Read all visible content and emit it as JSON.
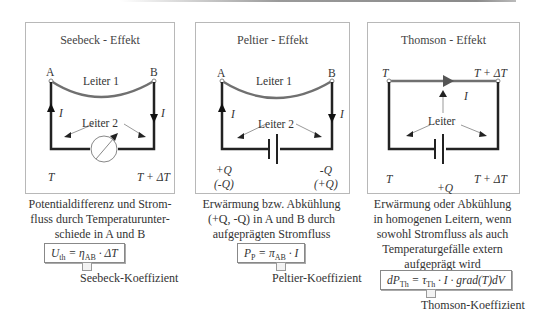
{
  "panels": [
    {
      "title": "Seebeck - Effekt",
      "node_left": "A",
      "node_right": "B",
      "wire_top": "Leiter 1",
      "wire_bottom": "Leiter 2",
      "current_left": "I",
      "current_right": "I",
      "temp_left": "T",
      "temp_right": "T + ΔT",
      "element": "voltmeter",
      "description": [
        "Potentialdifferenz und Strom-",
        "fluss durch Temperaturunter-",
        "schiede in A und B"
      ],
      "formula": {
        "lhs": "U",
        "lhs_sub": "th",
        "eq": " = ",
        "coef": "η",
        "coef_sub": "AB",
        "rhs": " · ΔT"
      },
      "coefficient_label": "Seebeck-Koeffizient"
    },
    {
      "title": "Peltier - Effekt",
      "node_left": "A",
      "node_right": "B",
      "wire_top": "Leiter 1",
      "wire_bottom": "Leiter 2",
      "current_left": "I",
      "current_right": "I",
      "heat_left": [
        "+Q",
        "(-Q)"
      ],
      "heat_right": [
        "-Q",
        "(+Q)"
      ],
      "element": "battery",
      "description": [
        "Erwärmung bzw. Abkühlung",
        "(+Q, -Q) in A und B durch",
        "aufgeprägten Stromfluss"
      ],
      "formula": {
        "lhs": "P",
        "lhs_sub": "P",
        "eq": " = ",
        "coef": "π",
        "coef_sub": "AB",
        "rhs": " · I"
      },
      "coefficient_label": "Peltier-Koeffizient"
    },
    {
      "title": "Thomson - Effekt",
      "temp_top_left": "T",
      "temp_top_right": "T + ΔT",
      "wire": "Leiter",
      "current": "I",
      "temp_left": "T",
      "temp_right": "T + ΔT",
      "heat": "+Q",
      "element": "battery",
      "description": [
        "Erwärmung oder Abkühlung",
        "in homogenen Leitern, wenn",
        "sowohl Stromfluss als auch",
        "Temperaturgefälle extern",
        "aufgeprägt wird"
      ],
      "formula": {
        "lhs": "dP",
        "lhs_sub": "Th",
        "eq": " = ",
        "coef": "τ",
        "coef_sub": "Th",
        "rhs": " · I · grad(T)dV"
      },
      "coefficient_label": "Thomson-Koeffizient"
    }
  ],
  "colors": {
    "wire_top": "#6e6e6e",
    "wire": "#222222",
    "border": "#b8b8b8"
  }
}
